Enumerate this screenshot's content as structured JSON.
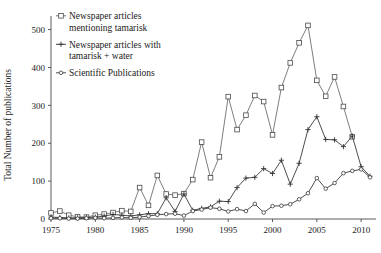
{
  "chart_data": {
    "type": "line",
    "title": "",
    "xlabel": "",
    "ylabel": "Total Number of publications",
    "xlim": [
      1975,
      2011
    ],
    "ylim": [
      0,
      520
    ],
    "yticks": [
      0,
      100,
      200,
      300,
      400,
      500
    ],
    "xticks": [
      1975,
      1980,
      1985,
      1990,
      1995,
      2000,
      2005,
      2010
    ],
    "grid": false,
    "legend_position": "top-left",
    "x": [
      1975,
      1976,
      1977,
      1978,
      1979,
      1980,
      1981,
      1982,
      1983,
      1984,
      1985,
      1986,
      1987,
      1988,
      1989,
      1990,
      1991,
      1992,
      1993,
      1994,
      1995,
      1996,
      1997,
      1998,
      1999,
      2000,
      2001,
      2002,
      2003,
      2004,
      2005,
      2006,
      2007,
      2008,
      2009,
      2010,
      2011
    ],
    "series": [
      {
        "name": "Newspaper articles mentioning tamarisk",
        "marker": "open-square",
        "color": "#5d5d5d",
        "values": [
          16,
          21,
          10,
          6,
          5,
          10,
          13,
          17,
          22,
          20,
          83,
          36,
          115,
          66,
          63,
          67,
          104,
          203,
          109,
          164,
          323,
          236,
          274,
          326,
          310,
          222,
          347,
          412,
          465,
          511,
          366,
          324,
          375,
          297,
          217,
          null,
          null
        ]
      },
      {
        "name": "Newspaper articles with tamarisk + water",
        "marker": "plus",
        "color": "#333333",
        "values": [
          5,
          4,
          3,
          3,
          4,
          5,
          8,
          12,
          10,
          8,
          11,
          14,
          14,
          56,
          20,
          66,
          23,
          28,
          32,
          47,
          46,
          83,
          108,
          110,
          133,
          120,
          155,
          92,
          147,
          236,
          270,
          210,
          209,
          191,
          219,
          138,
          113
        ]
      },
      {
        "name": "Scientific Publications",
        "marker": "circle",
        "color": "#3a3a3a",
        "values": [
          2,
          2,
          1,
          1,
          2,
          3,
          2,
          3,
          4,
          3,
          5,
          8,
          11,
          13,
          14,
          9,
          21,
          25,
          30,
          27,
          20,
          26,
          21,
          40,
          17,
          34,
          35,
          39,
          52,
          68,
          108,
          80,
          95,
          121,
          127,
          131,
          110
        ]
      }
    ],
    "legend": [
      "Newspaper articles mentioning tamarisk",
      "Newspaper articles with tamarisk + water",
      "Scientific Publications"
    ],
    "legend_lines": [
      [
        "Newspaper articles",
        "mentioning tamarisk"
      ],
      [
        "Newspaper articles with",
        "tamarisk + water"
      ],
      [
        "Scientific Publications"
      ]
    ]
  },
  "axis": {
    "y_label": "Total Number of publications",
    "y_tick_labels": [
      "0",
      "100",
      "200",
      "300",
      "400",
      "500"
    ],
    "x_tick_labels": [
      "1975",
      "1980",
      "1985",
      "1990",
      "1995",
      "2000",
      "2005",
      "2010"
    ]
  }
}
